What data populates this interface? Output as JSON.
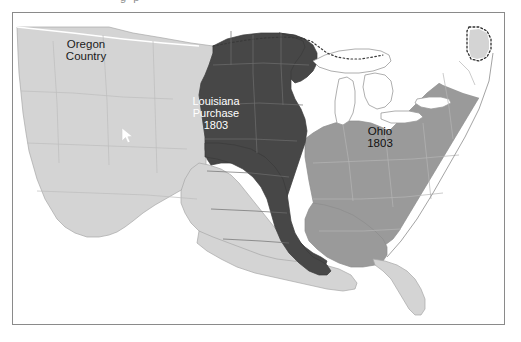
{
  "figure": {
    "cropped_caption_above": "g p",
    "frame": {
      "border_color": "#8a8a8a"
    }
  },
  "map": {
    "title_regions": [
      {
        "name": "Oregon Country",
        "label_lines": "Oregon\nCountry",
        "fill": "#d4d4d4",
        "text_color": "#1b1b1b"
      },
      {
        "name": "Louisiana Purchase",
        "label_lines": "Louisiana\nPurchase\n1803",
        "year": "1803",
        "fill": "#474747",
        "text_color": "#ffffff"
      },
      {
        "name": "Ohio",
        "label_lines": "Ohio\n1803",
        "year": "1803",
        "fill": "#9a9a9a",
        "text_color": "#111111"
      }
    ],
    "colors": {
      "louisiana_purchase_dark": "#474747",
      "western_light_gray": "#d4d4d4",
      "eastern_states_medium_gray": "#9a9a9a",
      "great_lakes_white": "#ffffff",
      "coastline_outline": "#9a9a9a",
      "state_border_line": "#b9b9b9",
      "dotted_border": "#3a3a3a",
      "background": "#ffffff"
    },
    "borders": {
      "northern_dotted": "dotted",
      "maine_disputed_dotted": "dotted"
    },
    "cursor": {
      "icon": "mouse-pointer-icon",
      "color": "#ffffff",
      "x": 108,
      "y": 114
    }
  }
}
